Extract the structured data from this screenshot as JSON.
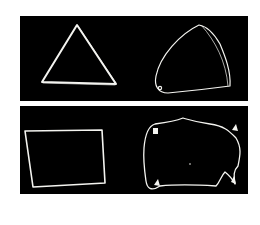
{
  "figure": {
    "background": "#ffffff",
    "panel_color": "#000000",
    "stroke_color": "#f4f4f0",
    "panels": [
      {
        "id": "top",
        "shapes": [
          {
            "name": "triangle-drawing",
            "kind": "straight-edged triangle"
          },
          {
            "name": "curved-triangle-drawing",
            "kind": "curved-edged triangle (reuleaux-like)",
            "markers": 1
          }
        ]
      },
      {
        "id": "bottom",
        "shapes": [
          {
            "name": "square-drawing",
            "kind": "straight-edged quadrilateral"
          },
          {
            "name": "irregular-blob-drawing",
            "kind": "irregular rounded outline",
            "markers": 4
          }
        ]
      }
    ]
  }
}
